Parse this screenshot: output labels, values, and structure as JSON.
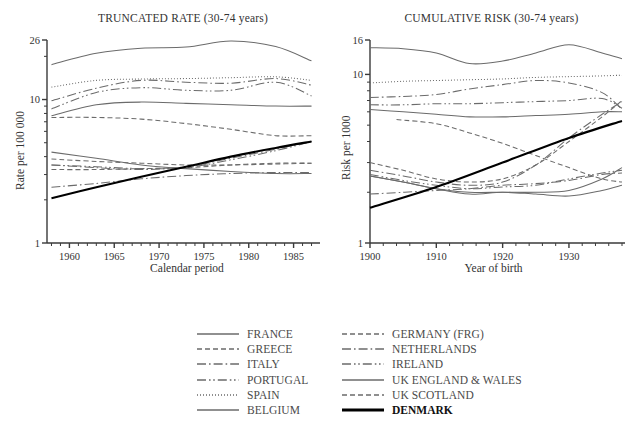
{
  "figure": {
    "width": 625,
    "height": 434,
    "background": "#ffffff",
    "line_color": "#6b6b6b",
    "highlight_color": "#000000"
  },
  "legend": {
    "columns": 2,
    "entries": [
      {
        "label": "FRANCE",
        "style": "solid",
        "width": 1.0,
        "color": "#6b6b6b"
      },
      {
        "label": "GREECE",
        "style": "dashed",
        "width": 1.0,
        "color": "#6b6b6b"
      },
      {
        "label": "ITALY",
        "style": "dashdot",
        "width": 1.0,
        "color": "#6b6b6b"
      },
      {
        "label": "PORTUGAL",
        "style": "dashdotdot",
        "width": 1.0,
        "color": "#6b6b6b"
      },
      {
        "label": "SPAIN",
        "style": "dotted",
        "width": 1.0,
        "color": "#6b6b6b"
      },
      {
        "label": "BELGIUM",
        "style": "solid",
        "width": 1.0,
        "color": "#6b6b6b"
      },
      {
        "label": "GERMANY (FRG)",
        "style": "dashed",
        "width": 1.0,
        "color": "#6b6b6b"
      },
      {
        "label": "NETHERLANDS",
        "style": "dashdot",
        "width": 1.0,
        "color": "#6b6b6b"
      },
      {
        "label": "IRELAND",
        "style": "dashdotdot",
        "width": 1.0,
        "color": "#6b6b6b"
      },
      {
        "label": "UK ENGLAND & WALES",
        "style": "solid",
        "width": 1.0,
        "color": "#6b6b6b"
      },
      {
        "label": "UK SCOTLAND",
        "style": "dashed",
        "width": 1.0,
        "color": "#6b6b6b"
      },
      {
        "label": "DENMARK",
        "style": "solid",
        "width": 2.1,
        "color": "#000000"
      }
    ]
  },
  "chart_data": [
    {
      "id": "truncated-rate",
      "type": "line",
      "title": "TRUNCATED RATE (30-74 years)",
      "xlabel": "Calendar period",
      "ylabel": "Rate per 100 000",
      "xlim": [
        1957.5,
        1987.5
      ],
      "ylim": [
        1,
        26
      ],
      "yscale": "log",
      "grid": false,
      "xticks_major": [
        1960,
        1965,
        1970,
        1975,
        1980,
        1985
      ],
      "xtick_step_minor": 1,
      "yticks_labeled": [
        1,
        10,
        26
      ],
      "yticks_minor": [
        2,
        3,
        4,
        5,
        6,
        7,
        8,
        9,
        20
      ],
      "legend_position": "below-figure",
      "series": [
        {
          "name": "FRANCE",
          "style": "dashdot",
          "x": [
            1958,
            1963,
            1968,
            1973,
            1978,
            1983,
            1987
          ],
          "y": [
            9.8,
            12.0,
            13.6,
            13.2,
            13.0,
            14.0,
            12.6
          ]
        },
        {
          "name": "GREECE",
          "style": "dashed",
          "x": [
            1958,
            1963,
            1968,
            1973,
            1978,
            1983,
            1987
          ],
          "y": [
            3.25,
            3.25,
            3.3,
            3.35,
            3.5,
            3.6,
            3.6
          ]
        },
        {
          "name": "ITALY",
          "style": "dashdot",
          "x": [
            1958,
            1963,
            1968,
            1973,
            1978,
            1983,
            1987
          ],
          "y": [
            2.45,
            2.6,
            2.8,
            2.95,
            3.05,
            3.1,
            3.1
          ]
        },
        {
          "name": "PORTUGAL",
          "style": "dashdotdot",
          "x": [
            1958,
            1963,
            1968,
            1973,
            1978,
            1983,
            1987
          ],
          "y": [
            8.6,
            11.2,
            12.1,
            11.6,
            11.6,
            13.2,
            10.6
          ]
        },
        {
          "name": "SPAIN",
          "style": "dotted",
          "x": [
            1958,
            1963,
            1968,
            1973,
            1978,
            1983,
            1987
          ],
          "y": [
            12.2,
            13.6,
            13.9,
            14.0,
            14.2,
            14.4,
            13.6
          ]
        },
        {
          "name": "BELGIUM",
          "style": "solid",
          "x": [
            1958,
            1963,
            1968,
            1973,
            1978,
            1983,
            1987
          ],
          "y": [
            7.7,
            9.2,
            9.6,
            9.4,
            9.2,
            9.0,
            9.0
          ]
        },
        {
          "name": "GERMANY (FRG)",
          "style": "dashed",
          "x": [
            1958,
            1963,
            1968,
            1973,
            1978,
            1983,
            1987
          ],
          "y": [
            7.5,
            7.5,
            7.3,
            6.8,
            6.2,
            5.6,
            5.6
          ]
        },
        {
          "name": "NETHERLANDS",
          "style": "dashdot",
          "x": [
            1958,
            1963,
            1968,
            1973,
            1978,
            1983,
            1987
          ],
          "y": [
            3.5,
            3.35,
            3.25,
            3.4,
            3.9,
            4.5,
            5.1
          ]
        },
        {
          "name": "IRELAND",
          "style": "dashdotdot",
          "x": [
            1958,
            1963,
            1968,
            1973,
            1978,
            1983,
            1987
          ],
          "y": [
            3.5,
            3.4,
            3.3,
            3.35,
            3.8,
            4.4,
            5.1
          ]
        },
        {
          "name": "UK ENGLAND & WALES",
          "style": "solid",
          "x": [
            1958,
            1963,
            1968,
            1973,
            1978,
            1983,
            1987
          ],
          "y": [
            4.3,
            3.9,
            3.5,
            3.3,
            3.15,
            3.05,
            3.05
          ]
        },
        {
          "name": "UK SCOTLAND",
          "style": "dashed",
          "x": [
            1958,
            1963,
            1968,
            1973,
            1978,
            1983,
            1987
          ],
          "y": [
            3.85,
            3.7,
            3.6,
            3.5,
            3.5,
            3.55,
            3.6
          ]
        },
        {
          "name": "DENMARK",
          "style": "solid",
          "x": [
            1958,
            1963,
            1968,
            1973,
            1978,
            1983,
            1987
          ],
          "y": [
            2.05,
            2.45,
            2.9,
            3.4,
            4.0,
            4.6,
            5.1
          ]
        },
        {
          "name": "FRANCE-TOP",
          "style": "solid",
          "x": [
            1958,
            1963,
            1968,
            1973,
            1978,
            1983,
            1987
          ],
          "y": [
            17.5,
            21.0,
            22.8,
            23.2,
            25.6,
            23.4,
            18.6
          ]
        }
      ]
    },
    {
      "id": "cumulative-risk",
      "type": "line",
      "title": "CUMULATIVE RISK (30-74 years)",
      "xlabel": "Year of birth",
      "ylabel": "Risk per 1000",
      "xlim": [
        1900,
        1938
      ],
      "ylim": [
        1,
        16
      ],
      "yscale": "log",
      "grid": false,
      "xticks_major": [
        1900,
        1910,
        1920,
        1930
      ],
      "xtick_step_minor": 2,
      "yticks_labeled": [
        1,
        10,
        16
      ],
      "yticks_minor": [
        2,
        3,
        4,
        5,
        6,
        7,
        8,
        9
      ],
      "legend_position": "below-figure",
      "series": [
        {
          "name": "FRANCE-TOP",
          "style": "solid",
          "x": [
            1900,
            1905,
            1910,
            1915,
            1920,
            1925,
            1930,
            1935,
            1938
          ],
          "y": [
            14.4,
            14.2,
            13.4,
            11.6,
            12.0,
            13.4,
            15.0,
            13.4,
            12.4
          ]
        },
        {
          "name": "SPAIN",
          "style": "dotted",
          "x": [
            1900,
            1905,
            1910,
            1915,
            1920,
            1925,
            1930,
            1935,
            1938
          ],
          "y": [
            8.9,
            9.1,
            9.2,
            9.3,
            9.4,
            9.6,
            9.7,
            9.8,
            9.9
          ]
        },
        {
          "name": "FRANCE",
          "style": "dashdot",
          "x": [
            1900,
            1905,
            1910,
            1915,
            1920,
            1925,
            1930,
            1935,
            1938
          ],
          "y": [
            7.3,
            7.4,
            7.6,
            8.2,
            8.7,
            9.2,
            8.9,
            7.8,
            6.2
          ]
        },
        {
          "name": "PORTUGAL",
          "style": "dashdotdot",
          "x": [
            1900,
            1905,
            1910,
            1915,
            1920,
            1925,
            1930,
            1935,
            1938
          ],
          "y": [
            6.6,
            6.6,
            6.7,
            6.7,
            6.8,
            6.9,
            7.0,
            7.2,
            6.3
          ]
        },
        {
          "name": "BELGIUM",
          "style": "solid",
          "x": [
            1900,
            1905,
            1910,
            1915,
            1920,
            1925,
            1930,
            1935,
            1938
          ],
          "y": [
            6.2,
            6.0,
            5.8,
            5.6,
            5.6,
            5.7,
            5.8,
            6.0,
            6.0
          ]
        },
        {
          "name": "GERMANY (FRG)",
          "style": "dashed",
          "x": [
            1904,
            1910,
            1915,
            1920,
            1925,
            1930,
            1935,
            1938
          ],
          "y": [
            5.4,
            5.1,
            4.5,
            3.9,
            3.3,
            2.8,
            2.4,
            2.3
          ]
        },
        {
          "name": "UK ENGLAND & WALES",
          "style": "solid",
          "x": [
            1900,
            1905,
            1910,
            1915,
            1920,
            1925,
            1930,
            1935,
            1938
          ],
          "y": [
            2.5,
            2.3,
            2.1,
            2.0,
            2.0,
            2.0,
            2.05,
            2.4,
            2.8
          ]
        },
        {
          "name": "UK SCOTLAND",
          "style": "dashed",
          "x": [
            1900,
            1905,
            1910,
            1915,
            1920,
            1925,
            1930,
            1935,
            1938
          ],
          "y": [
            3.0,
            2.7,
            2.4,
            2.3,
            2.4,
            2.9,
            4.0,
            5.6,
            7.0
          ]
        },
        {
          "name": "NETHERLANDS",
          "style": "dashdot",
          "x": [
            1900,
            1905,
            1910,
            1915,
            1920,
            1925,
            1930,
            1935,
            1938
          ],
          "y": [
            2.7,
            2.5,
            2.3,
            2.2,
            2.3,
            2.9,
            4.2,
            5.8,
            6.9
          ]
        },
        {
          "name": "IRELAND",
          "style": "dashdotdot",
          "x": [
            1900,
            1905,
            1910,
            1915,
            1920,
            1925,
            1930,
            1935,
            1938
          ],
          "y": [
            2.55,
            2.35,
            2.2,
            2.1,
            2.15,
            2.2,
            2.4,
            2.6,
            2.7
          ]
        },
        {
          "name": "ITALY",
          "style": "dashdot",
          "x": [
            1900,
            1905,
            1910,
            1915,
            1920,
            1925,
            1930,
            1935,
            1938
          ],
          "y": [
            1.95,
            2.0,
            2.05,
            2.1,
            2.2,
            2.25,
            2.35,
            2.55,
            2.6
          ]
        },
        {
          "name": "GREECE",
          "style": "solid",
          "x": [
            1900,
            1905,
            1910,
            1915,
            1920,
            1925,
            1930,
            1935,
            1938
          ],
          "y": [
            2.5,
            2.3,
            2.1,
            1.95,
            2.0,
            1.95,
            1.9,
            2.05,
            2.2
          ]
        },
        {
          "name": "DENMARK",
          "style": "solid",
          "x": [
            1900,
            1910,
            1920,
            1930,
            1938
          ],
          "y": [
            1.62,
            2.15,
            3.0,
            4.2,
            5.3
          ]
        }
      ]
    }
  ]
}
